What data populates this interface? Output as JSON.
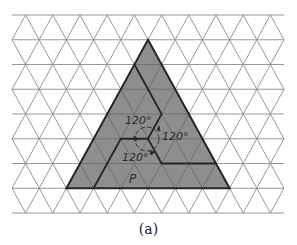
{
  "figure": {
    "caption": "(a)",
    "angle_labels": [
      "120°",
      "120°",
      "120°"
    ],
    "region_label": "P",
    "colors": {
      "grid": "#8c8c8c",
      "fill": "#8e8e8e",
      "outline": "#2a2a2a",
      "inner_grid": "#6f6f6f"
    },
    "grid": {
      "type": "triangular lattice",
      "rows": 8,
      "columns": 10
    },
    "shape": {
      "type": "equilateral triangle",
      "side_units": 6,
      "partition": "three congruent pieces in pinwheel arrangement, 120° rotational symmetry about center"
    }
  }
}
